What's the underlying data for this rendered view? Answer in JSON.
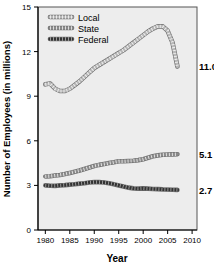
{
  "chart_data": {
    "type": "line",
    "title": "",
    "xlabel": "Year",
    "ylabel": "Number of Employees (in millions)",
    "xlim": [
      1978.5,
      2011
    ],
    "ylim": [
      0,
      15
    ],
    "xticks": [
      "1980",
      "1985",
      "1990",
      "1995",
      "2000",
      "2005",
      "2010"
    ],
    "xtick_values": [
      1980,
      1985,
      1990,
      1995,
      2000,
      2005,
      2010
    ],
    "yticks": [
      "0",
      "3",
      "6",
      "9",
      "12",
      "15"
    ],
    "ytick_values": [
      0,
      3,
      6,
      9,
      12,
      15
    ],
    "grid": false,
    "legend_position": "top-left",
    "x": [
      1980,
      1981,
      1982,
      1983,
      1984,
      1985,
      1986,
      1987,
      1988,
      1989,
      1990,
      1991,
      1992,
      1993,
      1994,
      1995,
      1996,
      1997,
      1998,
      1999,
      2000,
      2001,
      2002,
      2003,
      2004,
      2005,
      2006,
      2007
    ],
    "series": [
      {
        "name": "Local",
        "color": "#b8b8b8",
        "end_label": "11.0",
        "end_value": 11.0,
        "values": [
          9.8,
          9.85,
          9.5,
          9.35,
          9.35,
          9.5,
          9.75,
          10.0,
          10.3,
          10.6,
          10.9,
          11.1,
          11.3,
          11.5,
          11.7,
          11.9,
          12.1,
          12.35,
          12.6,
          12.85,
          13.1,
          13.35,
          13.55,
          13.7,
          13.7,
          13.4,
          12.6,
          11.0
        ]
      },
      {
        "name": "State",
        "color": "#8a8a8a",
        "end_label": "5.1",
        "end_value": 5.1,
        "values": [
          3.6,
          3.62,
          3.66,
          3.7,
          3.76,
          3.84,
          3.92,
          4.0,
          4.1,
          4.2,
          4.3,
          4.38,
          4.44,
          4.5,
          4.56,
          4.62,
          4.62,
          4.64,
          4.66,
          4.7,
          4.76,
          4.86,
          4.96,
          5.02,
          5.06,
          5.08,
          5.09,
          5.1
        ]
      },
      {
        "name": "Federal",
        "color": "#333333",
        "end_label": "2.7",
        "end_value": 2.7,
        "values": [
          3.0,
          2.98,
          2.97,
          3.0,
          3.02,
          3.05,
          3.08,
          3.12,
          3.15,
          3.2,
          3.22,
          3.22,
          3.2,
          3.15,
          3.08,
          3.0,
          2.92,
          2.85,
          2.8,
          2.78,
          2.8,
          2.78,
          2.76,
          2.75,
          2.73,
          2.72,
          2.71,
          2.7
        ]
      }
    ]
  }
}
